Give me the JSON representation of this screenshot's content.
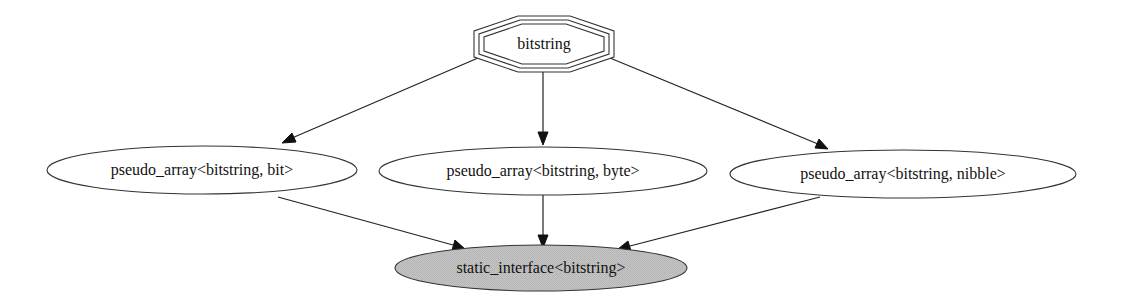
{
  "diagram": {
    "type": "directed-graph",
    "nodes": [
      {
        "id": "bitstring",
        "label": "bitstring",
        "shape": "tripleoctagon",
        "fill": "#ffffff"
      },
      {
        "id": "pa_bit",
        "label": "pseudo_array<bitstring, bit>",
        "shape": "ellipse",
        "fill": "#ffffff"
      },
      {
        "id": "pa_byte",
        "label": "pseudo_array<bitstring, byte>",
        "shape": "ellipse",
        "fill": "#ffffff"
      },
      {
        "id": "pa_nibble",
        "label": "pseudo_array<bitstring, nibble>",
        "shape": "ellipse",
        "fill": "#ffffff"
      },
      {
        "id": "static_iface",
        "label": "static_interface<bitstring>",
        "shape": "ellipse",
        "fill": "#c0c0c0"
      }
    ],
    "edges": [
      {
        "from": "bitstring",
        "to": "pa_bit"
      },
      {
        "from": "bitstring",
        "to": "pa_byte"
      },
      {
        "from": "bitstring",
        "to": "pa_nibble"
      },
      {
        "from": "pa_bit",
        "to": "static_iface"
      },
      {
        "from": "pa_byte",
        "to": "static_iface"
      },
      {
        "from": "pa_nibble",
        "to": "static_iface"
      }
    ]
  },
  "labels": {
    "bitstring": "bitstring",
    "pa_bit": "pseudo_array<bitstring, bit>",
    "pa_byte": "pseudo_array<bitstring, byte>",
    "pa_nibble": "pseudo_array<bitstring, nibble>",
    "static_iface": "static_interface<bitstring>"
  },
  "colors": {
    "edge": "#222222",
    "node_border": "#333333",
    "highlight_fill": "#c0c0c0"
  }
}
